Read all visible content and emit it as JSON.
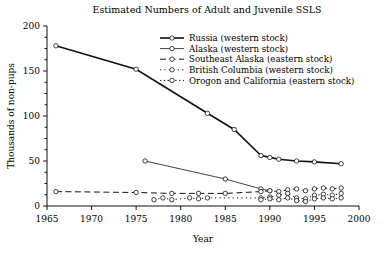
{
  "chart_data": {
    "type": "line",
    "title": "Estimated Numbers of Adult and Juvenile SSLS",
    "xlabel": "Year",
    "ylabel": "Thousands of non-pups",
    "xlim": [
      1965,
      2000
    ],
    "ylim": [
      0,
      200
    ],
    "xticks": [
      1965,
      1970,
      1975,
      1980,
      1985,
      1990,
      1995,
      2000
    ],
    "yticks": [
      0,
      50,
      100,
      150,
      200
    ],
    "yminor_step": 12.5,
    "grid": false,
    "legend_position": "top-right",
    "series": [
      {
        "name": "Russia (western stock)",
        "legend_label": "Russia (western stock)",
        "style": "solid-thick",
        "marker": "open-circle",
        "color": "#111111",
        "points": [
          [
            1966,
            178
          ],
          [
            1975,
            152
          ],
          [
            1983,
            103
          ],
          [
            1986,
            85
          ],
          [
            1989,
            56
          ],
          [
            1990,
            54
          ],
          [
            1991,
            52
          ],
          [
            1993,
            50
          ],
          [
            1995,
            49
          ],
          [
            1998,
            47
          ]
        ]
      },
      {
        "name": "Alaska (western stock)",
        "legend_label": "Alaska (western stock)",
        "style": "solid-thin",
        "marker": "open-circle",
        "color": "#111111",
        "points": [
          [
            1976,
            50
          ],
          [
            1985,
            30
          ],
          [
            1989,
            19
          ],
          [
            1990,
            17
          ]
        ]
      },
      {
        "name": "Southeast Alaska (eastern stock)",
        "legend_label": "Southeast Alaska (eastern stock)",
        "style": "dashed",
        "marker": "open-circle",
        "color": "#111111",
        "points": [
          [
            1966,
            16
          ],
          [
            1975,
            15
          ],
          [
            1979,
            14
          ],
          [
            1982,
            14
          ],
          [
            1985,
            14
          ],
          [
            1989,
            16
          ],
          [
            1990,
            17
          ],
          [
            1991,
            16
          ],
          [
            1992,
            18
          ],
          [
            1993,
            19
          ],
          [
            1994,
            17
          ],
          [
            1995,
            19
          ],
          [
            1996,
            20
          ],
          [
            1997,
            19
          ],
          [
            1998,
            20
          ]
        ]
      },
      {
        "name": "British Columbia (western stock)",
        "legend_label": "British Columbia (western stock)",
        "style": "dotted-sparse",
        "marker": "open-circle",
        "color": "#111111",
        "points": [
          [
            1977,
            7
          ],
          [
            1978,
            9
          ],
          [
            1979,
            7
          ],
          [
            1981,
            9
          ],
          [
            1982,
            8
          ],
          [
            1983,
            9
          ],
          [
            1989,
            9
          ],
          [
            1990,
            10
          ],
          [
            1991,
            12
          ],
          [
            1992,
            14
          ],
          [
            1993,
            9
          ],
          [
            1994,
            8
          ],
          [
            1995,
            12
          ],
          [
            1996,
            13
          ],
          [
            1997,
            12
          ],
          [
            1998,
            14
          ]
        ]
      },
      {
        "name": "Orogon and California (eastern stock)",
        "legend_label": "Orogon and California (eastern stock)",
        "style": "dotted",
        "marker": "open-circle",
        "color": "#111111",
        "points": [
          [
            1989,
            7
          ],
          [
            1990,
            8
          ],
          [
            1991,
            7
          ],
          [
            1992,
            9
          ],
          [
            1993,
            6
          ],
          [
            1994,
            5
          ],
          [
            1995,
            8
          ],
          [
            1996,
            9
          ],
          [
            1997,
            8
          ],
          [
            1998,
            9
          ]
        ]
      }
    ]
  }
}
